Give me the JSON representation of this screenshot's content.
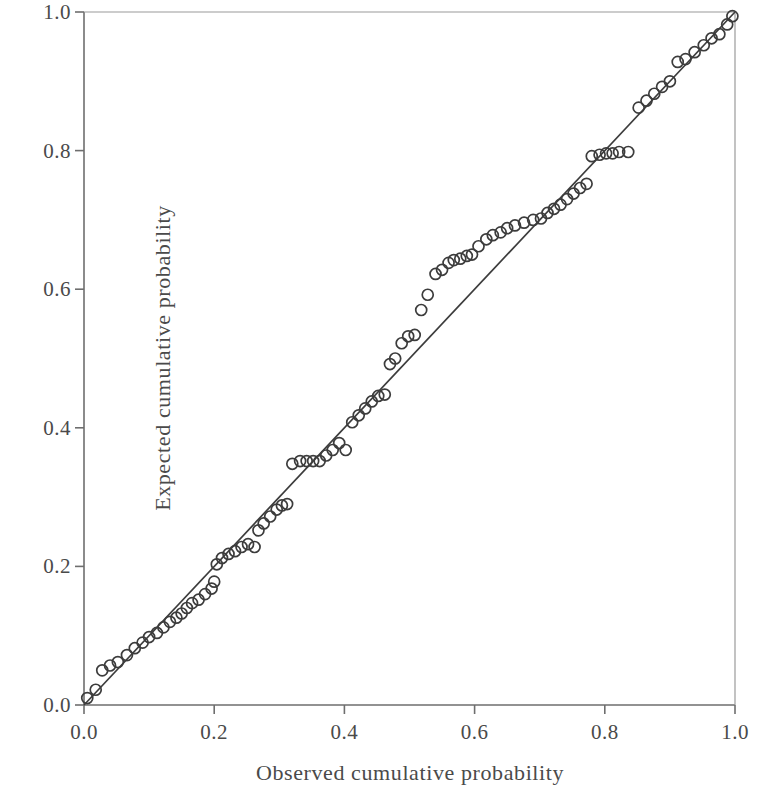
{
  "chart_data": {
    "type": "scatter",
    "title": "",
    "subtitle": "",
    "xlabel": "Observed cumulative probability",
    "ylabel": "Expected cumulative probability",
    "xlim": [
      0.0,
      1.0
    ],
    "ylim": [
      0.0,
      1.0
    ],
    "xticks": [
      "0.0",
      "0.2",
      "0.4",
      "0.6",
      "0.8",
      "1.0"
    ],
    "yticks": [
      "0.0",
      "0.2",
      "0.4",
      "0.6",
      "0.8",
      "1.0"
    ],
    "xtick_values": [
      0.0,
      0.2,
      0.4,
      0.6,
      0.8,
      1.0
    ],
    "ytick_values": [
      0.0,
      0.2,
      0.4,
      0.6,
      0.8,
      1.0
    ],
    "grid": false,
    "legend": null,
    "legend_position": "none",
    "marker": "open-circle",
    "marker_size_px": 11,
    "marker_color": "#3c3c3c",
    "marker_fill": "none",
    "line_color": "#3c3c3c",
    "frame_color": "#6e6e6e",
    "background_color": "#ffffff",
    "reference_line": {
      "name": "identity-line",
      "x": [
        0.0,
        1.0
      ],
      "y": [
        0.0,
        1.0
      ],
      "style": "solid"
    },
    "series": [
      {
        "name": "P-P plot points",
        "points": [
          [
            0.005,
            0.01
          ],
          [
            0.018,
            0.022
          ],
          [
            0.028,
            0.05
          ],
          [
            0.04,
            0.057
          ],
          [
            0.052,
            0.062
          ],
          [
            0.066,
            0.072
          ],
          [
            0.078,
            0.082
          ],
          [
            0.09,
            0.09
          ],
          [
            0.1,
            0.098
          ],
          [
            0.112,
            0.104
          ],
          [
            0.122,
            0.112
          ],
          [
            0.132,
            0.12
          ],
          [
            0.142,
            0.126
          ],
          [
            0.15,
            0.132
          ],
          [
            0.158,
            0.14
          ],
          [
            0.166,
            0.147
          ],
          [
            0.176,
            0.152
          ],
          [
            0.186,
            0.16
          ],
          [
            0.196,
            0.168
          ],
          [
            0.2,
            0.178
          ],
          [
            0.204,
            0.203
          ],
          [
            0.212,
            0.212
          ],
          [
            0.222,
            0.218
          ],
          [
            0.232,
            0.222
          ],
          [
            0.242,
            0.228
          ],
          [
            0.252,
            0.232
          ],
          [
            0.262,
            0.228
          ],
          [
            0.268,
            0.252
          ],
          [
            0.276,
            0.262
          ],
          [
            0.286,
            0.272
          ],
          [
            0.296,
            0.282
          ],
          [
            0.304,
            0.288
          ],
          [
            0.312,
            0.29
          ],
          [
            0.32,
            0.348
          ],
          [
            0.332,
            0.352
          ],
          [
            0.342,
            0.352
          ],
          [
            0.352,
            0.352
          ],
          [
            0.362,
            0.352
          ],
          [
            0.372,
            0.36
          ],
          [
            0.382,
            0.368
          ],
          [
            0.392,
            0.378
          ],
          [
            0.402,
            0.368
          ],
          [
            0.412,
            0.408
          ],
          [
            0.422,
            0.418
          ],
          [
            0.432,
            0.428
          ],
          [
            0.442,
            0.438
          ],
          [
            0.452,
            0.446
          ],
          [
            0.462,
            0.448
          ],
          [
            0.47,
            0.492
          ],
          [
            0.478,
            0.5
          ],
          [
            0.488,
            0.522
          ],
          [
            0.498,
            0.532
          ],
          [
            0.508,
            0.534
          ],
          [
            0.518,
            0.57
          ],
          [
            0.528,
            0.592
          ],
          [
            0.54,
            0.622
          ],
          [
            0.55,
            0.628
          ],
          [
            0.56,
            0.638
          ],
          [
            0.568,
            0.642
          ],
          [
            0.578,
            0.644
          ],
          [
            0.588,
            0.648
          ],
          [
            0.596,
            0.65
          ],
          [
            0.606,
            0.662
          ],
          [
            0.618,
            0.672
          ],
          [
            0.628,
            0.678
          ],
          [
            0.64,
            0.682
          ],
          [
            0.65,
            0.688
          ],
          [
            0.662,
            0.692
          ],
          [
            0.676,
            0.696
          ],
          [
            0.69,
            0.7
          ],
          [
            0.702,
            0.702
          ],
          [
            0.712,
            0.71
          ],
          [
            0.722,
            0.716
          ],
          [
            0.732,
            0.722
          ],
          [
            0.742,
            0.73
          ],
          [
            0.752,
            0.738
          ],
          [
            0.762,
            0.746
          ],
          [
            0.772,
            0.752
          ],
          [
            0.78,
            0.792
          ],
          [
            0.792,
            0.794
          ],
          [
            0.802,
            0.796
          ],
          [
            0.812,
            0.796
          ],
          [
            0.822,
            0.798
          ],
          [
            0.836,
            0.798
          ],
          [
            0.852,
            0.862
          ],
          [
            0.864,
            0.872
          ],
          [
            0.876,
            0.882
          ],
          [
            0.888,
            0.892
          ],
          [
            0.9,
            0.9
          ],
          [
            0.912,
            0.928
          ],
          [
            0.924,
            0.932
          ],
          [
            0.938,
            0.942
          ],
          [
            0.952,
            0.952
          ],
          [
            0.964,
            0.962
          ],
          [
            0.976,
            0.968
          ],
          [
            0.988,
            0.982
          ],
          [
            0.996,
            0.994
          ]
        ]
      }
    ]
  },
  "axes": {
    "x_title": "Observed cumulative probability",
    "y_title": "Expected cumulative probability",
    "x_labels": [
      "0.0",
      "0.2",
      "0.4",
      "0.6",
      "0.8",
      "1.0"
    ],
    "y_labels": [
      "0.0",
      "0.2",
      "0.4",
      "0.6",
      "0.8",
      "1.0"
    ]
  }
}
